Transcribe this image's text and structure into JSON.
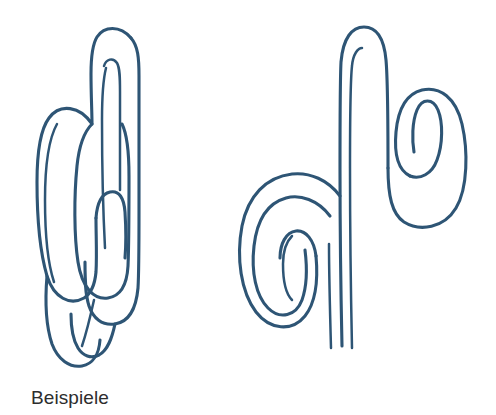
{
  "page": {
    "background_color": "#ffffff",
    "width": 496,
    "height": 415
  },
  "caption": {
    "text": "Beispiele",
    "color": "#2d2d2d"
  },
  "illustration": {
    "title": "Beispiele",
    "style": "hand-drawn continuous single-line meander loops",
    "ink_color": "#2e5575",
    "figure_count": 2,
    "figures": [
      {
        "name": "left-meander-figure",
        "description": "Continuous hand-drawn line forming a tall narrow arch at the top that folds back down into nested U-turns, ending in a descending tail loop at the bottom.",
        "bounds": {
          "x": 30,
          "y": 22,
          "width": 135,
          "height": 348
        },
        "loop_turns": 4
      },
      {
        "name": "right-meander-figure",
        "description": "Continuous hand-drawn line with a tall narrow arch at the top centre, a spiral loop curling inward at the lower left, a spiral loop curling inward at the upper right, and three vertical strokes trailing off at the bottom.",
        "bounds": {
          "x": 238,
          "y": 20,
          "width": 228,
          "height": 328
        },
        "loop_turns": 5
      }
    ]
  }
}
